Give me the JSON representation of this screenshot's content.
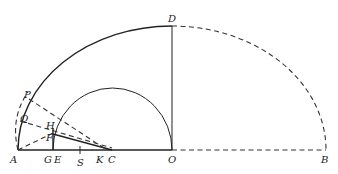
{
  "figure": {
    "points": {
      "A": "A",
      "G": "G",
      "E": "E",
      "S": "S",
      "K": "K",
      "C": "C",
      "O": "O",
      "B": "B",
      "D": "D",
      "P": "P",
      "Q": "Q",
      "H": "H",
      "F": "F"
    }
  }
}
